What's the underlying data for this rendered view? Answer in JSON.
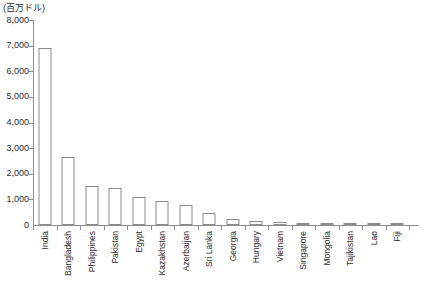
{
  "chart_data": {
    "type": "bar",
    "title": "",
    "subtitle": "",
    "unit_label": "(百万ドル)",
    "xlabel": "",
    "ylabel": "",
    "ylim": [
      0,
      8000
    ],
    "y_ticks": [
      "0",
      "1,000",
      "2,000",
      "3,000",
      "4,000",
      "5,000",
      "6,000",
      "7,000",
      "8,000"
    ],
    "y_tick_values": [
      0,
      1000,
      2000,
      3000,
      4000,
      5000,
      6000,
      7000,
      8000
    ],
    "grid": false,
    "legend": false,
    "categories": [
      "India",
      "Bangladesh",
      "Philippines",
      "Pakistan",
      "Egypt",
      "Kazakhstan",
      "Azerbaijan",
      "Sri Lanka",
      "Georgia",
      "Hungary",
      "Vietnam",
      "Singapore",
      "Mongolia",
      "Tajikistan",
      "Lao",
      "Fiji"
    ],
    "values": [
      6900,
      2650,
      1520,
      1440,
      1080,
      950,
      780,
      450,
      220,
      165,
      130,
      95,
      90,
      80,
      70,
      60
    ],
    "bar_style": {
      "fill": "#ffffff",
      "stroke": "#8c8c8c"
    },
    "axis_color": "#8c8c8c"
  }
}
